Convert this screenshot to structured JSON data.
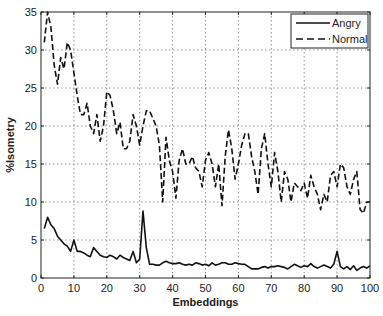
{
  "chart_data": {
    "type": "line",
    "title": "",
    "xlabel": "Embeddings",
    "ylabel": "%Isometry",
    "xlim": [
      0,
      100
    ],
    "ylim": [
      0,
      35
    ],
    "xticks": [
      0,
      10,
      20,
      30,
      40,
      50,
      60,
      70,
      80,
      90,
      100
    ],
    "yticks": [
      0,
      5,
      10,
      15,
      20,
      25,
      30,
      35
    ],
    "grid": true,
    "legend_position": "upper right",
    "x": [
      1,
      2,
      3,
      4,
      5,
      6,
      7,
      8,
      9,
      10,
      11,
      12,
      13,
      14,
      15,
      16,
      17,
      18,
      19,
      20,
      21,
      22,
      23,
      24,
      25,
      26,
      27,
      28,
      29,
      30,
      31,
      32,
      33,
      34,
      35,
      36,
      37,
      38,
      39,
      40,
      41,
      42,
      43,
      44,
      45,
      46,
      47,
      48,
      49,
      50,
      51,
      52,
      53,
      54,
      55,
      56,
      57,
      58,
      59,
      60,
      61,
      62,
      63,
      64,
      65,
      66,
      67,
      68,
      69,
      70,
      71,
      72,
      73,
      74,
      75,
      76,
      77,
      78,
      79,
      80,
      81,
      82,
      83,
      84,
      85,
      86,
      87,
      88,
      89,
      90,
      91,
      92,
      93,
      94,
      95,
      96,
      97,
      98,
      99,
      100
    ],
    "series": [
      {
        "name": "Angry",
        "style": "solid",
        "color": "#111111",
        "values": [
          6.5,
          8,
          7,
          6.5,
          5.5,
          5,
          4.5,
          4.2,
          3.5,
          5,
          3.5,
          3.5,
          3.3,
          3,
          2.8,
          4,
          3.5,
          3,
          2.8,
          2.7,
          3,
          2.8,
          2.5,
          3,
          2.7,
          2.5,
          2.3,
          3.5,
          2,
          2.5,
          8.8,
          4,
          1.8,
          1.8,
          1.7,
          1.7,
          2,
          2.2,
          2,
          1.9,
          1.9,
          2,
          1.8,
          1.7,
          1.8,
          1.7,
          2,
          1.9,
          1.7,
          1.8,
          1.6,
          2,
          1.7,
          1.8,
          2,
          2,
          1.8,
          1.8,
          2,
          1.9,
          1.8,
          1.8,
          1.5,
          1.2,
          1.2,
          1.2,
          1.4,
          1.5,
          1.3,
          1.5,
          1.5,
          1.6,
          1.5,
          1.4,
          1.2,
          1.5,
          1.8,
          1.6,
          1.4,
          1.6,
          1.5,
          1.9,
          1.5,
          1.3,
          1.5,
          1.7,
          1.5,
          1.3,
          1.8,
          3.5,
          1.5,
          1.2,
          1.5,
          1.1,
          1.6,
          1.0,
          1.3,
          1.5,
          1.3,
          1.6
        ]
      },
      {
        "name": "Normal",
        "style": "dashed",
        "color": "#111111",
        "values": [
          31,
          35,
          33,
          28,
          25.5,
          29,
          27.5,
          31,
          30,
          27,
          24,
          21.5,
          21.5,
          23,
          20,
          19,
          21.5,
          18,
          20,
          24.5,
          24,
          22,
          19,
          20.5,
          17,
          17,
          18,
          21.5,
          20,
          17.5,
          20,
          22,
          22,
          21,
          20,
          17.5,
          10,
          18.5,
          15.5,
          14,
          10.5,
          15.5,
          17,
          15,
          15,
          16,
          14.5,
          14,
          12,
          15.5,
          16.5,
          15,
          12,
          15,
          9.5,
          16,
          19.5,
          17,
          13,
          15,
          17.5,
          19,
          19,
          16,
          14,
          11,
          17,
          19,
          15,
          12,
          16.5,
          14,
          10,
          14,
          13,
          10,
          12.5,
          12,
          11.5,
          12.5,
          10.5,
          13.5,
          12,
          11,
          9,
          11,
          10,
          13.5,
          14,
          12,
          15,
          14.5,
          12,
          11,
          13,
          14,
          9,
          8.5,
          10,
          10
        ]
      }
    ]
  }
}
